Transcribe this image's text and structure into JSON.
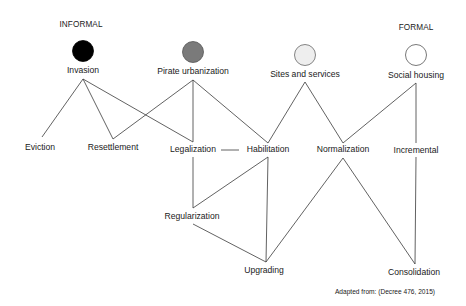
{
  "headers": {
    "informal": "INFORMAL",
    "formal": "FORMAL"
  },
  "origins": [
    {
      "id": "invasion",
      "label": "Invasion",
      "fill": "#000000",
      "stroke": "#000000"
    },
    {
      "id": "pirate_urbanization",
      "label": "Pirate urbanization",
      "fill": "#7a7a7a",
      "stroke": "#555555"
    },
    {
      "id": "sites_and_services",
      "label": "Sites and services",
      "fill": "#eeeeee",
      "stroke": "#666666"
    },
    {
      "id": "social_housing",
      "label": "Social housing",
      "fill": "#ffffff",
      "stroke": "#555555"
    }
  ],
  "nodes": {
    "eviction": "Eviction",
    "resettlement": "Resettlement",
    "legalization": "Legalization",
    "habilitation": "Habilitation",
    "normalization": "Normalization",
    "incremental": "Incremental",
    "regularization": "Regularization",
    "upgrading": "Upgrading",
    "consolidation": "Consolidation"
  },
  "edges": [
    [
      "Invasion",
      "Eviction"
    ],
    [
      "Invasion",
      "Resettlement"
    ],
    [
      "Invasion",
      "Legalization"
    ],
    [
      "Pirate urbanization",
      "Resettlement"
    ],
    [
      "Pirate urbanization",
      "Legalization"
    ],
    [
      "Pirate urbanization",
      "Habilitation"
    ],
    [
      "Sites and services",
      "Habilitation"
    ],
    [
      "Sites and services",
      "Normalization"
    ],
    [
      "Social housing",
      "Normalization"
    ],
    [
      "Social housing",
      "Incremental"
    ],
    [
      "Legalization",
      "Habilitation"
    ],
    [
      "Legalization",
      "Regularization"
    ],
    [
      "Habilitation",
      "Regularization"
    ],
    [
      "Habilitation",
      "Upgrading"
    ],
    [
      "Regularization",
      "Upgrading"
    ],
    [
      "Normalization",
      "Upgrading"
    ],
    [
      "Normalization",
      "Consolidation"
    ],
    [
      "Incremental",
      "Consolidation"
    ]
  ],
  "caption": "Adapted from: (Decree 476, 2015)"
}
